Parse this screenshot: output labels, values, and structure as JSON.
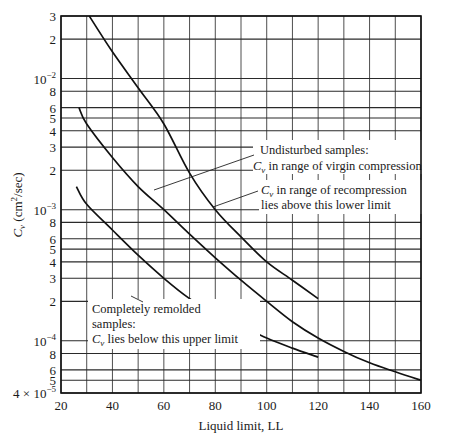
{
  "chart_data": {
    "type": "line",
    "title": "",
    "xlabel": "Liquid limit, LL",
    "ylabel": "C_v (cm²/sec)",
    "ylabel_parts": {
      "sym": "C",
      "sub": "v",
      "unit_open": " (cm",
      "sup": "2",
      "unit_close": "/sec)"
    },
    "xlim": [
      20,
      160
    ],
    "ylim": [
      4e-05,
      0.03
    ],
    "yscale": "log",
    "grid": true,
    "x_ticks": [
      20,
      30,
      40,
      50,
      60,
      70,
      80,
      90,
      100,
      110,
      120,
      130,
      140,
      150,
      160
    ],
    "x_tick_labels": [
      {
        "value": 20,
        "label": "20"
      },
      {
        "value": 40,
        "label": "40"
      },
      {
        "value": 60,
        "label": "60"
      },
      {
        "value": 80,
        "label": "80"
      },
      {
        "value": 100,
        "label": "100"
      },
      {
        "value": 120,
        "label": "120"
      },
      {
        "value": 140,
        "label": "140"
      },
      {
        "value": 160,
        "label": "160"
      }
    ],
    "y_gridlines": [
      0.03,
      0.02,
      0.01,
      0.008,
      0.006,
      0.005,
      0.004,
      0.003,
      0.002,
      0.001,
      0.0008,
      0.0006,
      0.0005,
      0.0004,
      0.0003,
      0.0002,
      0.0001,
      8e-05,
      6e-05,
      5e-05,
      4e-05
    ],
    "y_tick_labels": [
      {
        "value": 0.03,
        "label": "3"
      },
      {
        "value": 0.02,
        "label": "2"
      },
      {
        "value": 0.01,
        "label": "10",
        "sup": "−2"
      },
      {
        "value": 0.008,
        "label": "8"
      },
      {
        "value": 0.006,
        "label": "6"
      },
      {
        "value": 0.005,
        "label": "5"
      },
      {
        "value": 0.004,
        "label": "4"
      },
      {
        "value": 0.003,
        "label": "3"
      },
      {
        "value": 0.002,
        "label": "2"
      },
      {
        "value": 0.001,
        "label": "10",
        "sup": "−3"
      },
      {
        "value": 0.0008,
        "label": "8"
      },
      {
        "value": 0.0006,
        "label": "6"
      },
      {
        "value": 0.0005,
        "label": "5"
      },
      {
        "value": 0.0004,
        "label": "4"
      },
      {
        "value": 0.0003,
        "label": "3"
      },
      {
        "value": 0.0002,
        "label": "2"
      },
      {
        "value": 0.0001,
        "label": "10",
        "sup": "−4"
      },
      {
        "value": 8e-05,
        "label": "8"
      },
      {
        "value": 6e-05,
        "label": "6"
      },
      {
        "value": 5e-05,
        "label": "5"
      },
      {
        "value": 4e-05,
        "label": "4 × 10",
        "sup": "−5"
      }
    ],
    "series": [
      {
        "name": "Undisturbed samples: Cv in range of virgin compression",
        "x": [
          31,
          40,
          50,
          60,
          70,
          80,
          90,
          100,
          110,
          120
        ],
        "y": [
          0.03,
          0.016,
          0.0085,
          0.0045,
          0.0019,
          0.001,
          0.00062,
          0.0004,
          0.00029,
          0.00021
        ]
      },
      {
        "name": "Cv in range of recompression lies above this lower limit",
        "x": [
          27,
          30,
          40,
          50,
          60,
          70,
          80,
          90,
          100,
          110,
          120,
          130,
          140,
          150,
          160
        ],
        "y": [
          0.006,
          0.0045,
          0.0025,
          0.0015,
          0.001,
          0.00065,
          0.00043,
          0.00029,
          0.0002,
          0.00014,
          0.000105,
          8.3e-05,
          6.8e-05,
          5.8e-05,
          5e-05
        ]
      },
      {
        "name": "Completely remolded samples: Cv lies below this upper limit",
        "x": [
          26,
          30,
          40,
          50,
          60,
          70,
          80,
          90,
          100,
          110,
          120
        ],
        "y": [
          0.0015,
          0.0011,
          0.0007,
          0.00045,
          0.0003,
          0.00021,
          0.00016,
          0.00013,
          0.000105,
          8.8e-05,
          7.5e-05
        ]
      }
    ],
    "annotations": [
      {
        "lines": [
          "Undisturbed samples:",
          "C_v in range of virgin compression"
        ],
        "points_to_series": 0
      },
      {
        "lines": [
          "C_v in range of recompression",
          "lies above this lower limit"
        ],
        "points_to_series": 1
      },
      {
        "lines": [
          "Completely remolded",
          "samples:",
          "C_v lies below this upper limit"
        ],
        "points_to_series": 2
      }
    ]
  },
  "labels": {
    "xlabel": "Liquid limit, LL",
    "ylabel_sym": "C",
    "ylabel_sub": "v",
    "ylabel_unit_open": " (cm",
    "ylabel_sup": "2",
    "ylabel_unit_close": "/sec)",
    "ann_virgin_l1": "Undisturbed samples:",
    "ann_virgin_sym": "C",
    "ann_virgin_sub": "v",
    "ann_virgin_l2": " in range of virgin compression",
    "ann_recomp_sym": "C",
    "ann_recomp_sub": "v",
    "ann_recomp_l1": " in range of recompression",
    "ann_recomp_l2": "lies above this lower limit",
    "ann_remold_l1": "Completely remolded",
    "ann_remold_l2": "samples:",
    "ann_remold_sym": "C",
    "ann_remold_sub": "v",
    "ann_remold_l3": " lies below this upper limit"
  }
}
